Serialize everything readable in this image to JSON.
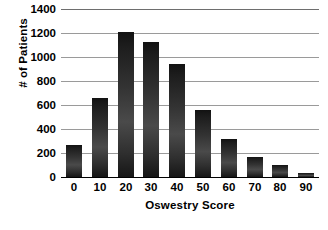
{
  "chart_data": {
    "type": "bar",
    "title": "",
    "xlabel": "Oswestry Score",
    "ylabel": "# of Patients",
    "categories": [
      "0",
      "10",
      "20",
      "30",
      "40",
      "50",
      "60",
      "70",
      "80",
      "90"
    ],
    "values": [
      265,
      655,
      1205,
      1125,
      945,
      560,
      315,
      170,
      100,
      30
    ],
    "series": [
      {
        "name": "# of Patients",
        "values": [
          265,
          655,
          1205,
          1125,
          945,
          560,
          315,
          170,
          100,
          30
        ]
      }
    ],
    "ylim": [
      0,
      1400
    ],
    "yticks": [
      "0",
      "200",
      "400",
      "600",
      "800",
      "1000",
      "1200",
      "1400"
    ],
    "ytick_values": [
      0,
      200,
      400,
      600,
      800,
      1000,
      1200,
      1400
    ],
    "xticks": [
      "0",
      "10",
      "20",
      "30",
      "40",
      "50",
      "60",
      "70",
      "80",
      "90"
    ],
    "grid": "horizontal",
    "legend": "none",
    "bar_color_top": "#121212",
    "bar_color_mid": "#4a4a4a",
    "bar_color_bottom": "#161616",
    "gridline_color": "#9a9a9a",
    "axis_color": "#000000",
    "background_color": "#ffffff"
  }
}
